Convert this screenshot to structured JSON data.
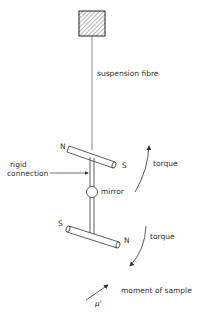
{
  "diagram": {
    "labels": {
      "fibre": "suspension fibre",
      "rigid1": "rigid",
      "rigid2": "connection",
      "mirror": "mirror",
      "torque_top": "torque",
      "torque_bottom": "torque",
      "moment": "moment of sample",
      "mu": "μ'",
      "upper_n": "N",
      "upper_s": "S",
      "lower_s": "S",
      "lower_n": "N"
    }
  }
}
